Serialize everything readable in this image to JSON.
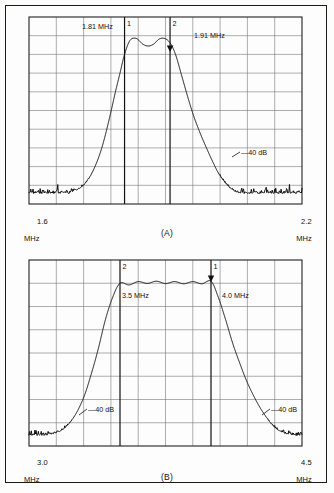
{
  "figure": {
    "type": "spectrum-analyzer-plots",
    "panels": [
      {
        "id": "A",
        "caption": "(A)",
        "axis": {
          "start_value": "1.6",
          "start_unit": "MHz",
          "end_value": "2.2",
          "end_unit": "MHz",
          "xmin": 1.6,
          "xmax": 2.2,
          "columns": 10,
          "rows": 10
        },
        "markers": [
          {
            "id": "1",
            "label": "1",
            "freq_text": "1.81  MHz",
            "freq": 1.81,
            "arrow": false
          },
          {
            "id": "2",
            "label": "2",
            "freq_text": "1.91  MHz",
            "freq": 1.91,
            "arrow": true
          }
        ],
        "annotations": [
          {
            "text": "—40 dB",
            "freq": 2.01,
            "level_frac": 0.74
          }
        ]
      },
      {
        "id": "B",
        "caption": "(B)",
        "axis": {
          "start_value": "3.0",
          "start_unit": "MHz",
          "end_value": "4.5",
          "end_unit": "MHz",
          "xmin": 3.0,
          "xmax": 4.5,
          "columns": 10,
          "rows": 8
        },
        "markers": [
          {
            "id": "2",
            "label": "2",
            "freq_text": "3.5 MHz",
            "freq": 3.5,
            "arrow": false
          },
          {
            "id": "1",
            "label": "1",
            "freq_text": "4.0 MHz",
            "freq": 4.0,
            "arrow": true
          }
        ],
        "annotations": [
          {
            "text": "—40 dB",
            "freq": 3.28,
            "level_frac": 0.76
          },
          {
            "text": "—40 dB",
            "freq": 4.17,
            "level_frac": 0.76
          }
        ]
      }
    ]
  },
  "chart_data": [
    {
      "type": "line",
      "title": "(A)",
      "xlabel": "MHz",
      "ylabel": "Relative amplitude (dB)",
      "xlim": [
        1.6,
        2.2
      ],
      "ylim": [
        0,
        1
      ],
      "grid": true,
      "legend": false,
      "xtick_labels": [
        "1.6 MHz",
        "2.2 MHz"
      ],
      "annotations": [
        "1",
        "1.81  MHz",
        "2",
        "1.91  MHz",
        "—40 dB"
      ],
      "series": [
        {
          "name": "filter-response-A",
          "x": [
            1.6,
            1.62,
            1.64,
            1.66,
            1.68,
            1.7,
            1.715,
            1.73,
            1.745,
            1.76,
            1.775,
            1.79,
            1.8,
            1.81,
            1.822,
            1.836,
            1.85,
            1.862,
            1.874,
            1.886,
            1.898,
            1.91,
            1.922,
            1.934,
            1.948,
            1.962,
            1.976,
            1.99,
            2.005,
            2.02,
            2.04,
            2.06,
            2.09,
            2.12,
            2.16,
            2.2
          ],
          "y": [
            0.04,
            0.05,
            0.04,
            0.06,
            0.05,
            0.07,
            0.09,
            0.13,
            0.2,
            0.3,
            0.44,
            0.6,
            0.7,
            0.8,
            0.875,
            0.885,
            0.855,
            0.845,
            0.855,
            0.882,
            0.885,
            0.862,
            0.8,
            0.7,
            0.58,
            0.47,
            0.38,
            0.3,
            0.22,
            0.15,
            0.09,
            0.06,
            0.05,
            0.06,
            0.05,
            0.04
          ]
        }
      ]
    },
    {
      "type": "line",
      "title": "(B)",
      "xlabel": "MHz",
      "ylabel": "Relative amplitude (dB)",
      "xlim": [
        3.0,
        4.5
      ],
      "ylim": [
        0,
        1
      ],
      "grid": true,
      "legend": false,
      "xtick_labels": [
        "3.0 MHz",
        "4.5 MHz"
      ],
      "annotations": [
        "2",
        "3.5 MHz",
        "1",
        "4.0 MHz",
        "—40 dB",
        "—40 dB"
      ],
      "series": [
        {
          "name": "filter-response-B",
          "x": [
            3.0,
            3.05,
            3.1,
            3.15,
            3.2,
            3.25,
            3.3,
            3.34,
            3.38,
            3.42,
            3.46,
            3.5,
            3.55,
            3.6,
            3.65,
            3.7,
            3.75,
            3.8,
            3.85,
            3.9,
            3.95,
            4.0,
            4.04,
            4.08,
            4.12,
            4.16,
            4.2,
            4.25,
            4.3,
            4.35,
            4.4,
            4.45,
            4.5
          ],
          "y": [
            0.05,
            0.05,
            0.06,
            0.07,
            0.1,
            0.16,
            0.26,
            0.38,
            0.52,
            0.68,
            0.8,
            0.875,
            0.866,
            0.884,
            0.874,
            0.886,
            0.873,
            0.884,
            0.872,
            0.884,
            0.872,
            0.886,
            0.8,
            0.68,
            0.55,
            0.44,
            0.34,
            0.24,
            0.16,
            0.1,
            0.07,
            0.06,
            0.05
          ]
        }
      ]
    }
  ],
  "colors": {
    "trace": "#111111",
    "grid": "#777777",
    "frame": "#222222",
    "marker_line": "#111111",
    "text": "#111111",
    "page_background": "#fdfdfc"
  }
}
